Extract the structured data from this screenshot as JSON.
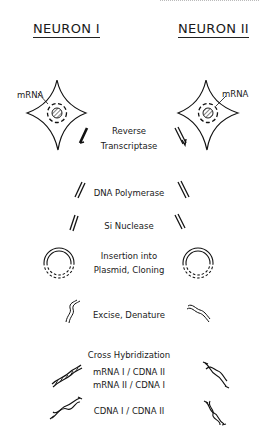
{
  "headers": {
    "left": "NEURON I",
    "right": "NEURON II"
  },
  "cells": {
    "left_label": "mRNA",
    "right_label": "mRNA"
  },
  "steps": [
    {
      "line1": "Reverse",
      "line2": "Transcriptase"
    },
    {
      "line1": "DNA Polymerase"
    },
    {
      "line1": "Si Nuclease"
    },
    {
      "line1": "Insertion into",
      "line2": "Plasmid, Cloning"
    },
    {
      "line1": "Excise, Denature"
    },
    {
      "line1": "Cross Hybridization"
    }
  ],
  "hybrids": {
    "pair1": "mRNA I / CDNA  II",
    "pair2": "mRNA II / CDNA  I",
    "pair3": "CDNA  I / CDNA  II"
  },
  "icons": [
    "neuron-cell-icon",
    "single-strand-icon",
    "double-strand-icon",
    "plasmid-icon",
    "denatured-strand-icon",
    "hybrid-duplex-icon"
  ]
}
